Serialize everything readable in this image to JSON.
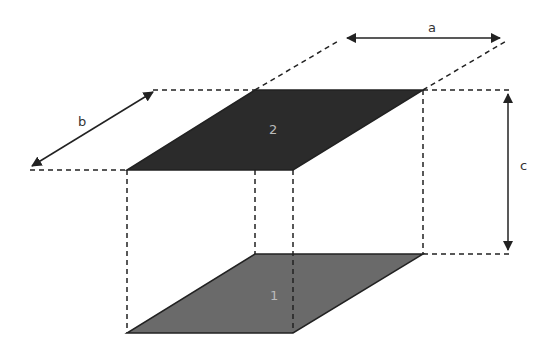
{
  "diagram": {
    "title": "",
    "faces": [
      {
        "id": "face-1",
        "label": "1",
        "fill": "#6a6a6a"
      },
      {
        "id": "face-2",
        "label": "2",
        "fill": "#2b2b2b"
      }
    ],
    "dimensions": [
      {
        "id": "dim-a",
        "label": "a"
      },
      {
        "id": "dim-b",
        "label": "b"
      },
      {
        "id": "dim-c",
        "label": "c"
      }
    ],
    "colors": {
      "line": "#222222",
      "dashed": "#222222",
      "background": "#ffffff"
    }
  }
}
